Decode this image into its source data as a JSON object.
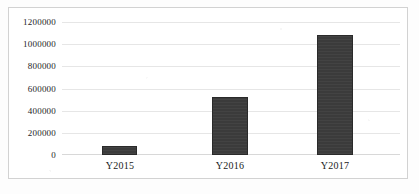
{
  "chart_data": {
    "type": "bar",
    "title": "",
    "subtitle": "",
    "xlabel": "",
    "ylabel": "",
    "categories": [
      "Y2015",
      "Y2016",
      "Y2017"
    ],
    "values": [
      80000,
      525000,
      1080000
    ],
    "series": [
      {
        "name": "",
        "values": [
          80000,
          525000,
          1080000
        ]
      }
    ],
    "ylim": [
      0,
      1200000
    ],
    "y_ticks": [
      0,
      200000,
      400000,
      600000,
      800000,
      1000000,
      1200000
    ],
    "y_tick_labels": [
      "0",
      "200000",
      "400000",
      "600000",
      "800000",
      "1000000",
      "1200000"
    ],
    "x_tick_labels": [
      "Y2015",
      "Y2016",
      "Y2017"
    ],
    "grid": true,
    "grid_axis": "y",
    "legend": false,
    "legend_position": "none",
    "annotations": [],
    "colors": {
      "bar_fill": "#3b3b3b",
      "bar_border": "#2a2a2a",
      "gridline": "#e6e6e6",
      "axis": "#d8d8d8",
      "frame_border": "#d2d2d2",
      "background": "#ffffff",
      "text": "#1a1a1a"
    }
  }
}
